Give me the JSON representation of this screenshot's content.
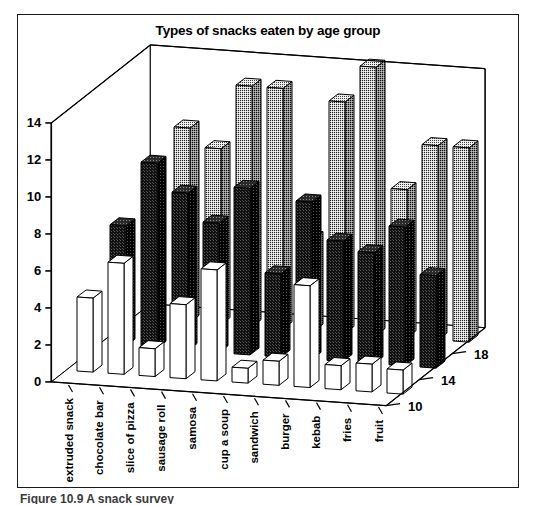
{
  "figure": {
    "title": "Types of snacks eaten by age group",
    "caption": "Figure 10.9 A snack survey"
  },
  "chart_data": {
    "type": "bar",
    "subtype": "3d-grouped-bar",
    "title": "Types of snacks eaten by age group",
    "xlabel": "",
    "ylabel": "",
    "zlabel": "",
    "grid": false,
    "legend": "none",
    "ylim": [
      0,
      14
    ],
    "yticks": [
      0,
      2,
      4,
      6,
      8,
      10,
      12,
      14
    ],
    "ytick_labels": [
      "0",
      "2",
      "4",
      "6",
      "8",
      "10",
      "12",
      "14"
    ],
    "ztick_labels": [
      "10",
      "14",
      "18"
    ],
    "categories": [
      "extruded snack",
      "chocolate bar",
      "slice of pizza",
      "sausage roll",
      "samosa",
      "cup a soup",
      "sandwich",
      "burger",
      "kebab",
      "fries",
      "fruit"
    ],
    "series": [
      {
        "name": "18",
        "fill": "light-dotted",
        "values": [
          0,
          10.5,
          9.5,
          13,
          13,
          5,
          12.5,
          14.5,
          8,
          10.5,
          10.5
        ]
      },
      {
        "name": "14",
        "fill": "dark-solid",
        "values": [
          6.5,
          10,
          8.5,
          7,
          9,
          4.5,
          8.5,
          6.5,
          6,
          7.5,
          5
        ]
      },
      {
        "name": "10",
        "fill": "white",
        "values": [
          4,
          6,
          1.5,
          4,
          6,
          0.8,
          1.3,
          5.5,
          1.3,
          1.5,
          1.3
        ]
      }
    ]
  }
}
